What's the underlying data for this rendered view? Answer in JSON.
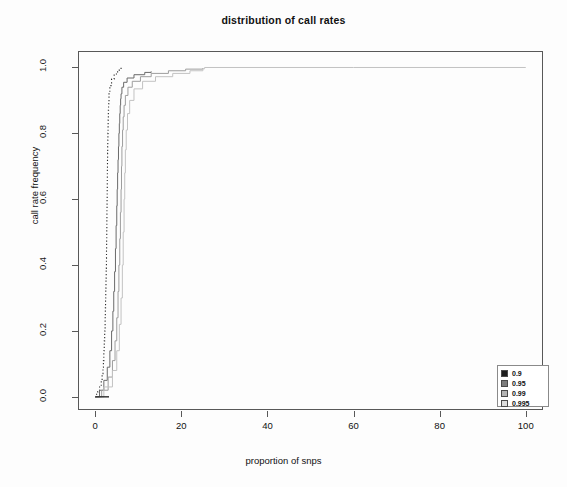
{
  "chart_data": {
    "type": "line",
    "title": "distribution of call rates",
    "xlabel": "proportion of snps",
    "ylabel": "call rate frequency",
    "xlim": [
      -4,
      104
    ],
    "ylim": [
      -0.04,
      1.05
    ],
    "xticks": [
      0,
      20,
      40,
      60,
      80,
      100
    ],
    "yticks": [
      "0.0",
      "0.2",
      "0.4",
      "0.6",
      "0.8",
      "1.0"
    ],
    "grid": false,
    "legend_position": "bottom-right",
    "legend_title": "",
    "series": [
      {
        "name": "0.9",
        "color": "#2b2b2b",
        "linestyle": "dotted",
        "key_fill": "#1e1e1e",
        "x": [
          0.0,
          0.3,
          0.6,
          1.0,
          1.4,
          1.6,
          1.8,
          1.9,
          2.0,
          2.1,
          2.2,
          2.3,
          2.35,
          2.4,
          2.45,
          2.5,
          2.55,
          2.6,
          2.62,
          2.65,
          2.68,
          2.7,
          2.72,
          2.75,
          2.78,
          2.8,
          2.82,
          2.85,
          2.88,
          2.9,
          2.92,
          2.95,
          2.98,
          3.0,
          3.05,
          3.1,
          3.2,
          3.4,
          3.8,
          4.4,
          5.2,
          6.0
        ],
        "y": [
          0.0,
          0.008,
          0.016,
          0.03,
          0.05,
          0.07,
          0.09,
          0.11,
          0.14,
          0.17,
          0.2,
          0.24,
          0.27,
          0.3,
          0.33,
          0.36,
          0.39,
          0.42,
          0.45,
          0.48,
          0.51,
          0.54,
          0.57,
          0.6,
          0.63,
          0.66,
          0.69,
          0.72,
          0.74,
          0.76,
          0.78,
          0.8,
          0.82,
          0.84,
          0.87,
          0.89,
          0.92,
          0.945,
          0.965,
          0.98,
          0.992,
          1.0
        ]
      },
      {
        "name": "0.95",
        "color": "#6a6a6a",
        "linestyle": "solid",
        "key_fill": "#7d7d7d",
        "x": [
          0.0,
          1.0,
          2.0,
          2.8,
          3.4,
          3.8,
          4.1,
          4.3,
          4.5,
          4.7,
          4.85,
          5.0,
          5.1,
          5.2,
          5.3,
          5.4,
          5.5,
          5.6,
          5.7,
          5.8,
          5.9,
          6.0,
          6.2,
          6.6,
          7.4,
          9.0,
          11.5,
          13.0
        ],
        "y": [
          0.0,
          0.02,
          0.05,
          0.09,
          0.14,
          0.2,
          0.26,
          0.32,
          0.38,
          0.45,
          0.52,
          0.58,
          0.63,
          0.68,
          0.72,
          0.76,
          0.8,
          0.83,
          0.86,
          0.885,
          0.905,
          0.92,
          0.94,
          0.955,
          0.968,
          0.978,
          0.985,
          0.988
        ]
      },
      {
        "name": "0.99",
        "color": "#9d9d9d",
        "linestyle": "solid",
        "key_fill": "#b4b4b4",
        "x": [
          0.0,
          1.5,
          3.0,
          4.0,
          4.6,
          5.0,
          5.3,
          5.5,
          5.7,
          5.85,
          6.0,
          6.1,
          6.2,
          6.35,
          6.5,
          6.7,
          7.0,
          7.6,
          8.6,
          10.5,
          13.0,
          17.0,
          21.0,
          25.0
        ],
        "y": [
          0.0,
          0.02,
          0.06,
          0.11,
          0.17,
          0.24,
          0.32,
          0.4,
          0.48,
          0.56,
          0.63,
          0.7,
          0.76,
          0.81,
          0.85,
          0.885,
          0.915,
          0.94,
          0.958,
          0.972,
          0.982,
          0.99,
          0.995,
          0.998
        ]
      },
      {
        "name": "0.995",
        "color": "#c2c2c2",
        "linestyle": "solid",
        "key_fill": "#dcdcdc",
        "x": [
          0.0,
          2.0,
          4.0,
          5.0,
          5.6,
          6.0,
          6.3,
          6.5,
          6.7,
          6.85,
          7.0,
          7.2,
          7.5,
          8.0,
          9.0,
          11.0,
          14.0,
          18.0,
          22.0,
          25.0,
          25.4,
          60.0,
          100.0
        ],
        "y": [
          0.0,
          0.03,
          0.08,
          0.14,
          0.22,
          0.3,
          0.4,
          0.5,
          0.6,
          0.68,
          0.75,
          0.81,
          0.86,
          0.9,
          0.935,
          0.958,
          0.972,
          0.982,
          0.99,
          0.996,
          1.0,
          1.0,
          1.0
        ]
      }
    ],
    "baseline_segment": {
      "x0": 0.0,
      "x1": 3.2,
      "y": 0.0,
      "color": "#2b2b2b"
    }
  }
}
